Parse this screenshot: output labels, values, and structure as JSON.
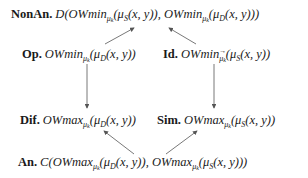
{
  "diagram": {
    "type": "commutative-square-of-opposition",
    "nodes": {
      "nonan": {
        "label": "NonAn.",
        "func": "D",
        "open": "(",
        "op1": "OWmin",
        "sub1": "μ",
        "subsub1": "k",
        "arg1": "(μ",
        "argsub1": "S",
        "argrest1": "(x, y)),",
        "op2": "OWmin",
        "sub2": "μ",
        "subsub2": "k",
        "arg2": "(μ",
        "argsub2": "D",
        "argrest2": "(x, y)))"
      },
      "op": {
        "label": "Op.",
        "op": "OWmin",
        "sub": "μ",
        "subsub": "k",
        "arg": "(μ",
        "argsub": "D",
        "argrest": "(x, y))"
      },
      "id": {
        "label": "Id.",
        "op": "OWmin",
        "sub": "μ",
        "subsub": "k",
        "arg": "(μ",
        "argsub": "S",
        "argrest": "(x, y))",
        "note": "subscript has overhead arrow"
      },
      "dif": {
        "label": "Dif.",
        "op": "OWmax",
        "sub": "μ",
        "subsub": "k",
        "arg": "(μ",
        "argsub": "D",
        "argrest": "(x, y))"
      },
      "sim": {
        "label": "Sim.",
        "op": "OWmax",
        "sub": "μ",
        "subsub": "k",
        "arg": "(μ",
        "argsub": "S",
        "argrest": "(x, y))"
      },
      "an": {
        "label": "An.",
        "func": "C",
        "open": "(",
        "op1": "OWmax",
        "sub1": "μ",
        "subsub1": "k",
        "arg1": "(μ",
        "argsub1": "D",
        "argrest1": "(x, y)),",
        "op2": "OWmax",
        "sub2": "μ",
        "subsub2": "k",
        "arg2": "(μ",
        "argsub2": "S",
        "argrest2": "(x, y)))"
      }
    },
    "edges": [
      {
        "from": "op",
        "to": "nonan"
      },
      {
        "from": "id",
        "to": "nonan"
      },
      {
        "from": "op",
        "to": "dif"
      },
      {
        "from": "id",
        "to": "sim"
      },
      {
        "from": "an",
        "to": "dif"
      },
      {
        "from": "an",
        "to": "sim"
      }
    ],
    "colors": {
      "text": "#1a1a1a",
      "arrow": "#555555",
      "background": "#ffffff"
    }
  }
}
